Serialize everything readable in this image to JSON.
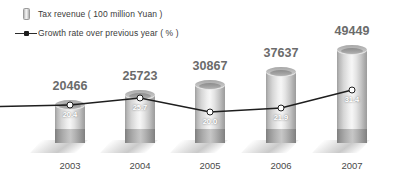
{
  "legend": {
    "items": [
      {
        "key": "cylinder-swatch",
        "label": "Tax revenue ( 100 million Yuan )"
      },
      {
        "key": "line-marker-swatch",
        "label": "Growth rate over previous year ( % )"
      }
    ]
  },
  "colors": {
    "bar_light": "#f6f6f6",
    "bar_mid": "#c6c6c6",
    "bar_dark": "#9b9b9b",
    "bar_base": "#7e7e7e",
    "line": "#1e1e1e",
    "marker_fill": "#ffffff",
    "value_text": "#6b6b6b",
    "rate_text": "#ffffff",
    "axis_text": "#4a4a4a",
    "background": "#ffffff"
  },
  "chart_data": {
    "type": "bar",
    "title": "",
    "subtitle": "",
    "xlabel": "",
    "ylabel": "",
    "grid": false,
    "legend_position": "top-left",
    "categories": [
      "2003",
      "2004",
      "2005",
      "2006",
      "2007"
    ],
    "series": [
      {
        "name": "Tax revenue ( 100 million Yuan )",
        "type": "bar",
        "axis": "left",
        "values": [
          20466,
          25723,
          30867,
          37637,
          49449
        ],
        "labels": [
          "20466",
          "25723",
          "30867",
          "37637",
          "49449"
        ]
      },
      {
        "name": "Growth rate over previous year ( % )",
        "type": "line",
        "axis": "right",
        "values": [
          20.4,
          25.7,
          20.0,
          21.9,
          31.4
        ],
        "labels": [
          "20.4",
          "25.7",
          "20.0",
          "21.9",
          "31.4"
        ]
      }
    ],
    "ylim": [
      0,
      52000
    ],
    "y2lim": [
      0,
      35
    ]
  }
}
